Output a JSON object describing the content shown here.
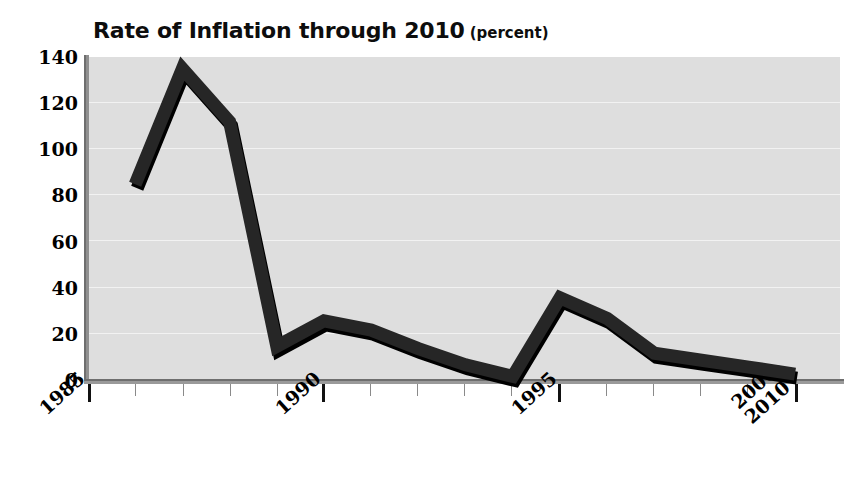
{
  "chart_data": {
    "type": "line",
    "title": "Rate of Inflation through 2010",
    "title_unit": "(percent)",
    "xlabel": "",
    "ylabel": "",
    "ylim": [
      0,
      140
    ],
    "ytick_values": [
      140,
      120,
      100,
      80,
      60,
      40,
      20,
      0
    ],
    "ytick_labels": [
      "140",
      "120",
      "100",
      "80",
      "60",
      "40",
      "20",
      "0"
    ],
    "xtick_labels": [
      "1985",
      "1990",
      "1995",
      "2000-\n2010"
    ],
    "xtick_label_positions": [
      1985,
      1990,
      1995,
      2010
    ],
    "grid": true,
    "legend": false,
    "x": [
      1986,
      1987,
      1988,
      1989,
      1990,
      1991,
      1992,
      1993,
      1994,
      1995,
      1996,
      1997,
      1998,
      1999,
      2010
    ],
    "values": [
      85,
      135,
      112,
      15,
      26,
      22,
      14,
      7,
      2,
      36,
      27,
      12,
      9,
      6,
      3
    ],
    "series": [
      {
        "name": "Rate of Inflation",
        "values": [
          85,
          135,
          112,
          15,
          26,
          22,
          14,
          7,
          2,
          36,
          27,
          12,
          9,
          6,
          3
        ]
      }
    ],
    "colors": {
      "line": "#262626",
      "line_shadow": "#000000",
      "plot_background": "#dedede",
      "gridline": "#f2f2f2",
      "axis": "#6e6e6e",
      "text": "#000000"
    }
  }
}
